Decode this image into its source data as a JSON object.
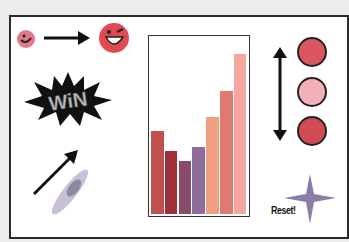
{
  "scene": {
    "reset_label": "Reset!",
    "win_label": "WiN"
  },
  "colors": {
    "small_face": "#e07a8a",
    "big_face": "#e04a52",
    "circle_top": "#d95560",
    "circle_middle": "#f2b0b8",
    "circle_bottom": "#d24a54",
    "star": "#8a7fa8"
  },
  "chart_data": {
    "type": "bar",
    "title": "",
    "xlabel": "",
    "ylabel": "",
    "categories": [
      "1",
      "2",
      "3",
      "4",
      "5",
      "6",
      "7"
    ],
    "values": [
      47,
      36,
      30,
      38,
      55,
      70,
      91
    ],
    "colors": [
      "#c0504d",
      "#a0303a",
      "#8a4a6a",
      "#8e6d9a",
      "#f0a080",
      "#e07a70",
      "#f4a6a0"
    ],
    "ylim": [
      0,
      100
    ]
  }
}
